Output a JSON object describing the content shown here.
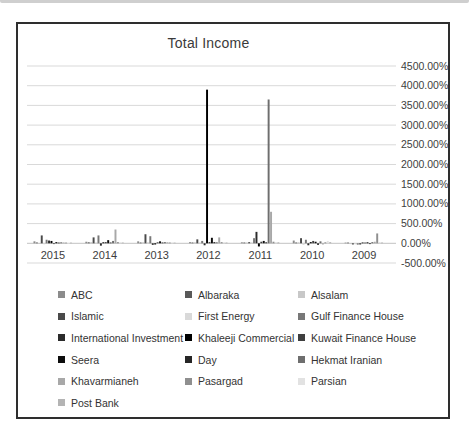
{
  "chart_data": {
    "type": "bar",
    "title": "Total Income",
    "categories": [
      "2015",
      "2014",
      "2013",
      "2012",
      "2011",
      "2010",
      "2009"
    ],
    "y_axis": {
      "min": -500,
      "max": 4500,
      "step": 500,
      "labels": [
        "4500.00%",
        "4000.00%",
        "3500.00%",
        "3000.00%",
        "2500.00%",
        "2000.00%",
        "1500.00%",
        "1000.00%",
        "500.00%",
        "0.00%",
        "-500.00%"
      ]
    },
    "grid": true,
    "legend_position": "bottom",
    "series": [
      {
        "name": "ABC",
        "color": "#8c8c8c",
        "values": [
          50,
          40,
          50,
          30,
          25,
          70,
          15
        ]
      },
      {
        "name": "Albaraka",
        "color": "#595959",
        "values": [
          20,
          25,
          20,
          20,
          20,
          20,
          10
        ]
      },
      {
        "name": "Alsalam",
        "color": "#c8c8c8",
        "values": [
          -15,
          30,
          25,
          25,
          20,
          25,
          -20
        ]
      },
      {
        "name": "Islamic",
        "color": "#4a4a4a",
        "values": [
          200,
          150,
          230,
          100,
          30,
          130,
          -30
        ]
      },
      {
        "name": "First Energy",
        "color": "#d9d9d9",
        "values": [
          -25,
          20,
          30,
          20,
          25,
          -40,
          -25
        ]
      },
      {
        "name": "Gulf Finance House",
        "color": "#787878",
        "values": [
          90,
          200,
          180,
          60,
          130,
          90,
          -35
        ]
      },
      {
        "name": "International Investment",
        "color": "#2b2b2b",
        "values": [
          70,
          -60,
          -40,
          -50,
          290,
          -50,
          -30
        ]
      },
      {
        "name": "Khaleeji Commercial",
        "color": "#000000",
        "values": [
          60,
          25,
          -30,
          3900,
          -80,
          30,
          20
        ]
      },
      {
        "name": "Kuwait Finance House",
        "color": "#3f3f3f",
        "values": [
          -20,
          30,
          25,
          30,
          40,
          60,
          15
        ]
      },
      {
        "name": "Seera",
        "color": "#0d0d0d",
        "values": [
          30,
          80,
          50,
          140,
          60,
          40,
          25
        ]
      },
      {
        "name": "Day",
        "color": "#262626",
        "values": [
          15,
          20,
          20,
          30,
          25,
          -40,
          -20
        ]
      },
      {
        "name": "Hekmat Iranian",
        "color": "#6e6e6e",
        "values": [
          25,
          60,
          30,
          25,
          3650,
          50,
          30
        ]
      },
      {
        "name": "Khavarmianeh",
        "color": "#a8a8a8",
        "values": [
          20,
          350,
          25,
          150,
          800,
          -30,
          40
        ]
      },
      {
        "name": "Pasargad",
        "color": "#8f8f8f",
        "values": [
          15,
          30,
          20,
          30,
          40,
          25,
          250
        ]
      },
      {
        "name": "Parsian",
        "color": "#e2e2e2",
        "values": [
          -10,
          25,
          15,
          25,
          30,
          60,
          30
        ]
      },
      {
        "name": "Post Bank",
        "color": "#b4b4b4",
        "values": [
          10,
          20,
          10,
          20,
          25,
          30,
          20
        ]
      }
    ]
  }
}
